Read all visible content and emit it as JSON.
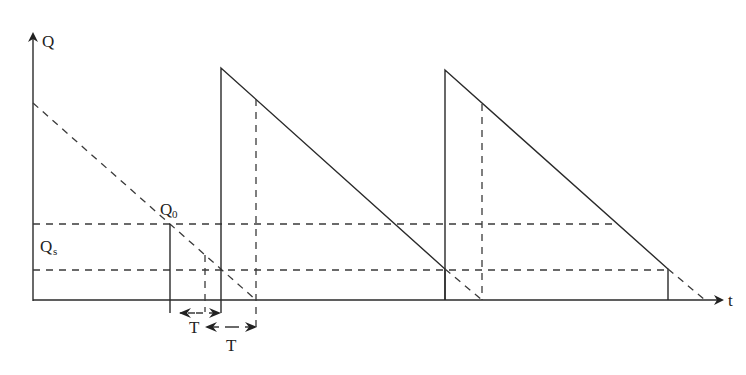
{
  "diagram": {
    "type": "inventory-sawtooth",
    "axes": {
      "y_label": "Q",
      "x_label": "t"
    },
    "levels": [
      {
        "name": "Q0",
        "label_main": "Q",
        "label_sub": "0"
      },
      {
        "name": "Qs",
        "label_main": "Q",
        "label_sub": "s"
      }
    ],
    "intervals": [
      {
        "label": "T"
      },
      {
        "label": "T"
      }
    ],
    "colors": {
      "line": "#2a2a2a",
      "background": "#ffffff"
    }
  }
}
